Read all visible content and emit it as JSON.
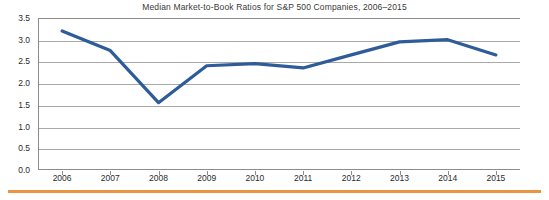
{
  "chart_data": {
    "type": "line",
    "title": "Median Market-to-Book Ratios for S&P 500 Companies, 2006–2015",
    "xlabel": "",
    "ylabel": "",
    "categories": [
      "2006",
      "2007",
      "2008",
      "2009",
      "2010",
      "2011",
      "2012",
      "2013",
      "2014",
      "2015"
    ],
    "x": [
      2006,
      2007,
      2008,
      2009,
      2010,
      2011,
      2012,
      2013,
      2014,
      2015
    ],
    "series": [
      {
        "name": "Median Market-to-Book Ratio",
        "values": [
          3.2,
          2.75,
          1.55,
          2.4,
          2.45,
          2.35,
          2.65,
          2.95,
          3.0,
          2.65
        ],
        "color": "#2e5c99"
      }
    ],
    "ylim": [
      0.0,
      3.5
    ],
    "ytick_labels": [
      "0.0",
      "0.5",
      "1.0",
      "1.5",
      "2.0",
      "2.5",
      "3.0",
      "3.5"
    ],
    "ytick_values": [
      0.0,
      0.5,
      1.0,
      1.5,
      2.0,
      2.5,
      3.0,
      3.5
    ],
    "grid": true,
    "grid_axis": "y",
    "legend": false,
    "legend_position": "none",
    "annotations": []
  },
  "figure": {
    "background_color": "#ffffff",
    "axis_color": "#8c8c8c",
    "grid_color": "#a8a8a8",
    "title_color": "#3a3a3a",
    "footer_rule_color": "#ea9442"
  }
}
